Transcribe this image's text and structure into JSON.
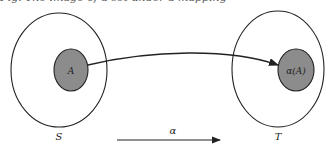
{
  "caption": "Fig. The image of a set under a mapping",
  "diagram": {
    "domain_set": {
      "label": "S",
      "subset_label": "A"
    },
    "codomain_set": {
      "label": "T",
      "subset_label": "α(A)"
    },
    "mapping_label": "α",
    "colors": {
      "subset_fill": "#8c8c8c",
      "stroke": "#222222"
    }
  }
}
